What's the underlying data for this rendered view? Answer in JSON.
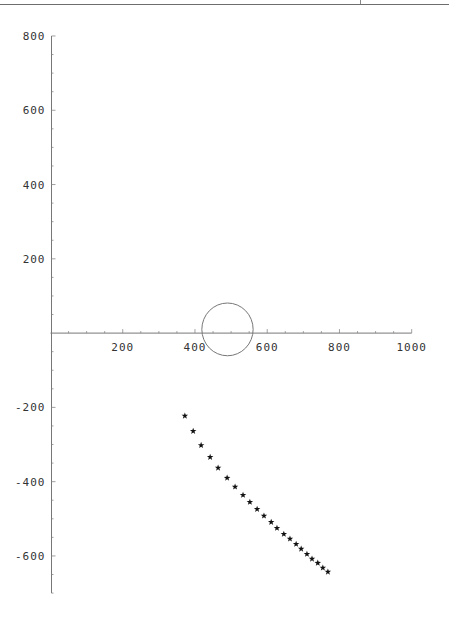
{
  "page": {
    "header_rule": true
  },
  "chart_data": {
    "type": "scatter",
    "title": "",
    "xlabel": "",
    "ylabel": "",
    "xlim": [
      0,
      1000
    ],
    "ylim": [
      -700,
      800
    ],
    "grid": false,
    "x_ticks": [
      200,
      400,
      600,
      800,
      1000
    ],
    "y_ticks": [
      -600,
      -400,
      -200,
      200,
      400,
      600,
      800
    ],
    "x_tick_labels": [
      "200",
      "400",
      "600",
      "800",
      "1000"
    ],
    "y_tick_labels": [
      "-600",
      "-400",
      "-200",
      "200",
      "400",
      "600",
      "800"
    ],
    "minor_tick_step": 50,
    "series": [
      {
        "name": "stars",
        "marker": "star",
        "color": "#111111",
        "x": [
          372,
          395,
          417,
          442,
          464,
          489,
          511,
          533,
          552,
          572,
          591,
          611,
          627,
          646,
          663,
          680,
          694,
          710,
          724,
          740,
          754,
          768
        ],
        "y": [
          -223,
          -264,
          -302,
          -334,
          -363,
          -390,
          -414,
          -436,
          -455,
          -474,
          -492,
          -509,
          -525,
          -541,
          -554,
          -568,
          -581,
          -595,
          -608,
          -619,
          -632,
          -643
        ]
      }
    ],
    "shapes": [
      {
        "type": "circle",
        "cx": 490,
        "cy": 10,
        "r": 71,
        "color": "#777777"
      }
    ]
  },
  "layout": {
    "origin_px": [
      50.5,
      333.1
    ],
    "scale_x": 0.3612,
    "scale_y": 0.3714
  }
}
